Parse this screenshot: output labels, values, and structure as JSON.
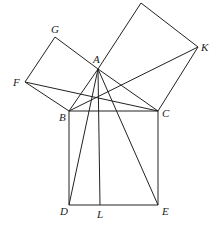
{
  "points": {
    "A": {
      "x": 98,
      "y": 69
    },
    "B": {
      "x": 69,
      "y": 111
    },
    "C": {
      "x": 158,
      "y": 111
    },
    "D": {
      "x": 69,
      "y": 205
    },
    "E": {
      "x": 158,
      "y": 205
    },
    "L": {
      "x": 100,
      "y": 205
    },
    "G": {
      "x": 55,
      "y": 37
    },
    "F": {
      "x": 25,
      "y": 82
    },
    "K": {
      "x": 198,
      "y": 47
    },
    "H": {
      "x": 141,
      "y": 3
    }
  },
  "labels": {
    "A": "A",
    "B": "B",
    "C": "C",
    "D": "D",
    "E": "E",
    "F": "F",
    "G": "G",
    "K": "K",
    "L": "L"
  }
}
